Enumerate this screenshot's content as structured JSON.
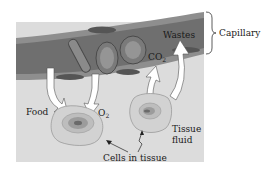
{
  "diagram": {
    "labels": {
      "capillary": "Capillary",
      "wastes": "Wastes",
      "co2_main": "CO",
      "co2_sub": "2",
      "food": "Food",
      "o2_main": "O",
      "o2_sub": "2",
      "tissue_fluid_line1": "Tissue",
      "tissue_fluid_line2": "fluid",
      "cells_in_tissue": "Cells in tissue"
    },
    "colors": {
      "tissue_fluid": "#d9d9d9",
      "capillary_wall": "#8c8c8c",
      "capillary_lumen": "#6e6e6e",
      "red_cell": "#7a7a7a",
      "arrow": "#ffffff",
      "cell_outline": "#9a9a9a"
    },
    "arrows": [
      {
        "from": "capillary",
        "to": "cell-1",
        "substance": "Food"
      },
      {
        "from": "capillary",
        "to": "cell-1",
        "substance": "O2"
      },
      {
        "from": "cell-2",
        "to": "capillary",
        "substance": "CO2"
      },
      {
        "from": "cell-2",
        "to": "capillary",
        "substance": "Wastes"
      }
    ]
  }
}
